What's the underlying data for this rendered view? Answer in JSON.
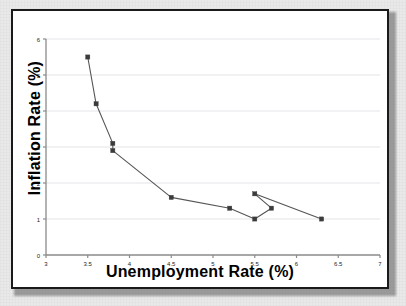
{
  "chart_data": {
    "type": "line",
    "title": "",
    "xlabel": "Unemployment Rate (%)",
    "ylabel": "Inflation Rate (%)",
    "xlim": [
      3,
      7
    ],
    "ylim": [
      0,
      6
    ],
    "xticks": [
      3,
      3.5,
      4,
      4.5,
      5,
      5.5,
      6,
      6.5,
      7
    ],
    "xticklabels": [
      "3",
      "3.5",
      "4",
      "4.5",
      "5",
      "5.5",
      "6",
      "6.5",
      "7"
    ],
    "yticks": [
      0,
      1,
      2,
      3,
      4,
      5,
      6
    ],
    "yticklabels": [
      "0",
      "1",
      "2",
      "3",
      "4",
      "5",
      "6"
    ],
    "grid": "horizontal",
    "legend": "none",
    "marker": "square",
    "line_color": "#555555",
    "marker_color": "#3b3b3b",
    "grid_color": "#e4e4e8",
    "axis_color": "#8a8a8a",
    "series": [
      {
        "name": "Phillips Curve",
        "x": [
          3.5,
          3.6,
          3.8,
          3.8,
          4.5,
          5.2,
          5.5,
          5.7,
          5.5,
          6.3
        ],
        "y": [
          5.5,
          4.2,
          3.1,
          2.9,
          1.6,
          1.3,
          1.0,
          1.3,
          1.7,
          1.0
        ]
      }
    ],
    "points": [
      {
        "x": 3.5,
        "y": 5.5
      },
      {
        "x": 3.6,
        "y": 4.2
      },
      {
        "x": 3.8,
        "y": 3.1
      },
      {
        "x": 3.8,
        "y": 2.9
      },
      {
        "x": 4.5,
        "y": 1.6
      },
      {
        "x": 5.2,
        "y": 1.3
      },
      {
        "x": 5.5,
        "y": 1.0
      },
      {
        "x": 5.7,
        "y": 1.3
      },
      {
        "x": 5.5,
        "y": 1.7
      },
      {
        "x": 6.3,
        "y": 1.0
      }
    ]
  },
  "axes": {
    "x_title": "Unemployment Rate (%)",
    "y_title": "Inflation Rate (%)"
  }
}
